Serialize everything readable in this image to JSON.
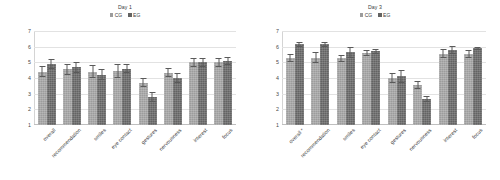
{
  "figure": {
    "background": "#ffffff",
    "series_colors": {
      "CG": "#9c9c9c",
      "EG": "#636363"
    }
  },
  "panels": [
    {
      "id": "day1",
      "title": "Day 1",
      "legend": [
        {
          "label": "CG",
          "swatch": "legend-swatch-cg"
        },
        {
          "label": "EG",
          "swatch": "legend-swatch-eg"
        }
      ],
      "yticks": [
        "7",
        "6",
        "5",
        "4",
        "3",
        "2",
        "1"
      ],
      "categories": [
        "overall",
        "recommendation",
        "smiles",
        "eye contact",
        "gestures",
        "nervousness",
        "interest",
        "focus"
      ]
    },
    {
      "id": "day3",
      "title": "Day 3",
      "legend": [
        {
          "label": "CG",
          "swatch": "legend-swatch-cg"
        },
        {
          "label": "EG",
          "swatch": "legend-swatch-eg"
        }
      ],
      "yticks": [
        "7",
        "6",
        "5",
        "4",
        "3",
        "2",
        "1"
      ],
      "categories": [
        "overall *",
        "recommendation",
        "smiles",
        "eye contact",
        "gestures",
        "nervousness",
        "interest",
        "focus"
      ]
    }
  ],
  "chart_data": [
    {
      "type": "bar",
      "title": "Day 1",
      "xlabel": "",
      "ylabel": "",
      "ylim": [
        1,
        7
      ],
      "yticks": [
        1,
        2,
        3,
        4,
        5,
        6,
        7
      ],
      "grid": true,
      "legend_position": "top-center",
      "categories": [
        "overall",
        "recommendation",
        "smiles",
        "eye contact",
        "gestures",
        "nervousness",
        "interest",
        "focus"
      ],
      "series": [
        {
          "name": "CG",
          "values": [
            4.4,
            4.55,
            4.4,
            4.45,
            3.7,
            4.35,
            5.0,
            5.0
          ],
          "errors": [
            0.35,
            0.35,
            0.4,
            0.45,
            0.3,
            0.3,
            0.3,
            0.3
          ]
        },
        {
          "name": "EG",
          "values": [
            4.9,
            4.7,
            4.2,
            4.6,
            2.8,
            4.0,
            5.0,
            5.1
          ],
          "errors": [
            0.3,
            0.35,
            0.35,
            0.3,
            0.3,
            0.3,
            0.3,
            0.25
          ]
        }
      ]
    },
    {
      "type": "bar",
      "title": "Day 3",
      "xlabel": "",
      "ylabel": "",
      "ylim": [
        1,
        7
      ],
      "yticks": [
        1,
        2,
        3,
        4,
        5,
        6,
        7
      ],
      "grid": true,
      "legend_position": "top-center",
      "categories": [
        "overall *",
        "recommendation",
        "smiles",
        "eye contact",
        "gestures",
        "nervousness",
        "interest",
        "focus"
      ],
      "series": [
        {
          "name": "CG",
          "values": [
            5.3,
            5.3,
            5.25,
            5.6,
            4.0,
            3.55,
            5.55,
            5.55
          ],
          "errors": [
            0.25,
            0.35,
            0.25,
            0.2,
            0.35,
            0.25,
            0.3,
            0.25
          ]
        },
        {
          "name": "EG",
          "values": [
            6.15,
            6.15,
            5.65,
            5.7,
            4.1,
            2.65,
            5.8,
            5.9
          ],
          "errors": [
            0.15,
            0.15,
            0.35,
            0.15,
            0.4,
            0.2,
            0.25,
            0.1
          ]
        }
      ]
    }
  ]
}
